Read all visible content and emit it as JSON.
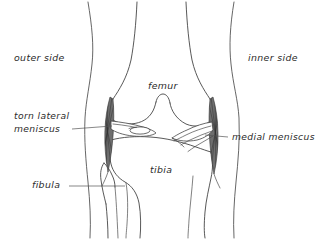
{
  "diagram": {
    "background_color": "#ffffff",
    "ink_color": "#3a3a3a",
    "leader_color": "#555555",
    "ligament_shade_color": "#6e6e6e"
  },
  "labels": {
    "outer_side": "outer side",
    "inner_side": "inner side",
    "femur": "femur",
    "tibia": "tibia",
    "fibula": "fibula",
    "torn_lateral_meniscus_line1": "torn lateral",
    "torn_lateral_meniscus_line2": "meniscus",
    "medial_meniscus": "medial meniscus"
  },
  "annotations": [
    {
      "name": "outer-side",
      "text": "outer side",
      "position": {
        "x": 14,
        "y": 58
      },
      "has_leader": false
    },
    {
      "name": "inner-side",
      "text": "inner side",
      "position": {
        "x": 248,
        "y": 58
      },
      "has_leader": false
    },
    {
      "name": "femur",
      "text": "femur",
      "position": {
        "x": 148,
        "y": 86
      },
      "has_leader": false
    },
    {
      "name": "tibia",
      "text": "tibia",
      "position": {
        "x": 150,
        "y": 170
      },
      "has_leader": false
    },
    {
      "name": "torn-lateral-meniscus",
      "text": "torn lateral meniscus",
      "position": {
        "x": 14,
        "y": 115
      },
      "has_leader": true,
      "leader": {
        "x1": 72,
        "y1": 129,
        "x2": 112,
        "y2": 126
      }
    },
    {
      "name": "medial-meniscus",
      "text": "medial meniscus",
      "position": {
        "x": 232,
        "y": 137
      },
      "has_leader": true,
      "leader": {
        "x1": 228,
        "y1": 137,
        "x2": 205,
        "y2": 135
      }
    },
    {
      "name": "fibula",
      "text": "fibula",
      "position": {
        "x": 32,
        "y": 185
      },
      "has_leader": true,
      "leader": {
        "x1": 69,
        "y1": 186,
        "x2": 125,
        "y2": 186
      }
    }
  ]
}
